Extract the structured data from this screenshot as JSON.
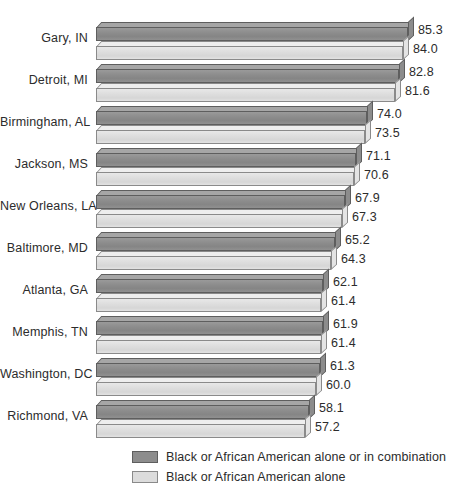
{
  "chart_data": {
    "type": "bar",
    "orientation": "horizontal",
    "title": "",
    "xlabel": "",
    "ylabel": "",
    "xlim": [
      0,
      100
    ],
    "grid": false,
    "legend_position": "bottom",
    "categories": [
      "Gary, IN",
      "Detroit, MI",
      "Birmingham, AL",
      "Jackson, MS",
      "New Orleans, LA",
      "Baltimore, MD",
      "Atlanta, GA",
      "Memphis, TN",
      "Washington, DC",
      "Richmond, VA"
    ],
    "series": [
      {
        "name": "Black or African American alone or in combination",
        "color": "#8d8d8d",
        "values": [
          85.3,
          82.8,
          74.0,
          71.1,
          67.9,
          65.2,
          62.1,
          61.9,
          61.3,
          58.1
        ],
        "labels": [
          "85.3",
          "82.8",
          "74.0",
          "71.1",
          "67.9",
          "65.2",
          "62.1",
          "61.9",
          "61.3",
          "58.1"
        ]
      },
      {
        "name": "Black or African American alone",
        "color": "#dcdcdc",
        "values": [
          84.0,
          81.6,
          73.5,
          70.6,
          67.3,
          64.3,
          61.4,
          61.4,
          60.0,
          57.2
        ],
        "labels": [
          "84.0",
          "81.6",
          "73.5",
          "70.6",
          "67.3",
          "64.3",
          "61.4",
          "61.4",
          "60.0",
          "57.2"
        ]
      }
    ]
  },
  "legend": {
    "items": [
      {
        "label": "Black or African American alone or in combination"
      },
      {
        "label": "Black or African American alone"
      }
    ]
  }
}
